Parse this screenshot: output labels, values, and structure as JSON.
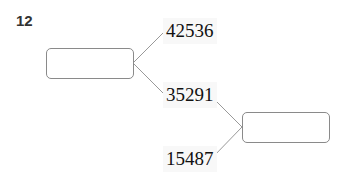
{
  "problem": {
    "number": "12",
    "left_box": {
      "value": ""
    },
    "right_box": {
      "value": ""
    },
    "numbers": [
      "42536",
      "35291",
      "15487"
    ]
  }
}
